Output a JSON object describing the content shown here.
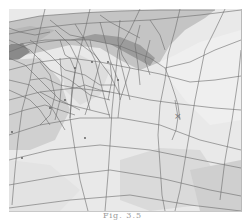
{
  "figure": {
    "caption": "Fig. 3.5",
    "colors": {
      "background": "#ffffff",
      "surface_light": "#ececec",
      "surface_mid": "#d6d6d6",
      "surface_dark": "#b0b0b0",
      "edge": "#6a6a6a"
    },
    "marker": {
      "glyph": "×",
      "x": 178,
      "y": 117
    }
  }
}
